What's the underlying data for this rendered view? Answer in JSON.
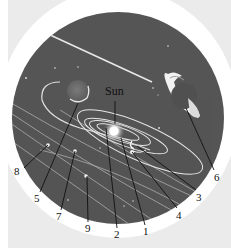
{
  "diagram": {
    "center_label": "Sun",
    "callouts": [
      {
        "id": "8",
        "label": "8",
        "target": [
          48,
          145
        ],
        "text_pos": [
          14,
          170
        ]
      },
      {
        "id": "5",
        "label": "5",
        "target": [
          78,
          103
        ],
        "text_pos": [
          34,
          196
        ]
      },
      {
        "id": "7",
        "label": "7",
        "target": [
          75,
          151
        ],
        "text_pos": [
          56,
          214
        ]
      },
      {
        "id": "9",
        "label": "9",
        "target": [
          87,
          176
        ],
        "text_pos": [
          85,
          226
        ]
      },
      {
        "id": "2",
        "label": "2",
        "target": [
          106,
          128
        ],
        "text_pos": [
          114,
          232
        ]
      },
      {
        "id": "1",
        "label": "1",
        "target": [
          121,
          138
        ],
        "text_pos": [
          142,
          229
        ]
      },
      {
        "id": "4",
        "label": "4",
        "target": [
          132,
          152
        ],
        "text_pos": [
          176,
          213
        ]
      },
      {
        "id": "3",
        "label": "3",
        "target": [
          137,
          146
        ],
        "text_pos": [
          196,
          195
        ]
      },
      {
        "id": "6",
        "label": "6",
        "target": [
          186,
          110
        ],
        "text_pos": [
          214,
          176
        ]
      }
    ],
    "colors": {
      "space": "#555555",
      "orbit": "#d8d8d8",
      "ring_frame": "#ffffff",
      "page_band": "#ebebeb",
      "leader_line": "#111111"
    }
  }
}
